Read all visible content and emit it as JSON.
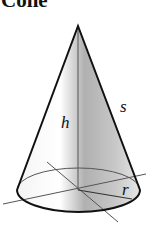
{
  "title": "Cone",
  "labels": {
    "height": "h",
    "slant": "s",
    "radius": "r"
  },
  "colors": {
    "outline": "#111111",
    "axis": "#555555"
  }
}
